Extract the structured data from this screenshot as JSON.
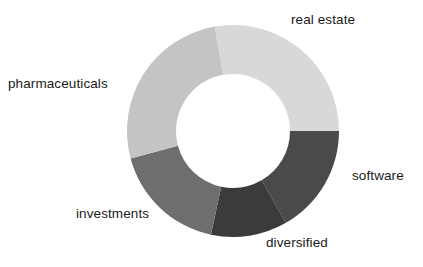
{
  "chart_data": {
    "type": "pie",
    "variant": "donut",
    "title": "",
    "subtitle": "",
    "xlabel": "",
    "ylabel": "",
    "legend_position": "none",
    "labels_position": "outside",
    "grid": false,
    "center_x": 233,
    "center_y": 131,
    "outer_radius": 106,
    "inner_radius": 57,
    "start_angle_deg": -10,
    "direction": "clockwise",
    "categories": [
      "real estate",
      "software",
      "diversified",
      "investments",
      "pharmaceuticals"
    ],
    "values": [
      100,
      60,
      42,
      63,
      95
    ],
    "unit": "degrees",
    "percentages": [
      27.8,
      16.7,
      11.7,
      17.5,
      26.4
    ],
    "colors": [
      "#d8d8d8",
      "#4a4a4a",
      "#3b3b3b",
      "#6e6e6e",
      "#c4c4c4"
    ],
    "slices": [
      {
        "label": "real estate",
        "value": 100,
        "percent": 27.8,
        "color": "#d8d8d8",
        "start_angle_deg": -10,
        "end_angle_deg": 90,
        "label_anchor": "top-right"
      },
      {
        "label": "software",
        "value": 60,
        "percent": 16.7,
        "color": "#4a4a4a",
        "start_angle_deg": 90,
        "end_angle_deg": 150,
        "label_anchor": "right"
      },
      {
        "label": "diversified",
        "value": 42,
        "percent": 11.7,
        "color": "#3b3b3b",
        "start_angle_deg": 150,
        "end_angle_deg": 192,
        "label_anchor": "bottom-right"
      },
      {
        "label": "investments",
        "value": 63,
        "percent": 17.5,
        "color": "#6e6e6e",
        "start_angle_deg": 192,
        "end_angle_deg": 255,
        "label_anchor": "bottom-left"
      },
      {
        "label": "pharmaceuticals",
        "value": 95,
        "percent": 26.4,
        "color": "#c4c4c4",
        "start_angle_deg": 255,
        "end_angle_deg": 350,
        "label_anchor": "left"
      }
    ]
  },
  "labels": {
    "real_estate": "real estate",
    "software": "software",
    "diversified": "diversified",
    "investments": "investments",
    "pharmaceuticals": "pharmaceuticals"
  },
  "style": {
    "background": "#ffffff",
    "label_color": "#1a1a1a",
    "hole_color": "#ffffff"
  }
}
